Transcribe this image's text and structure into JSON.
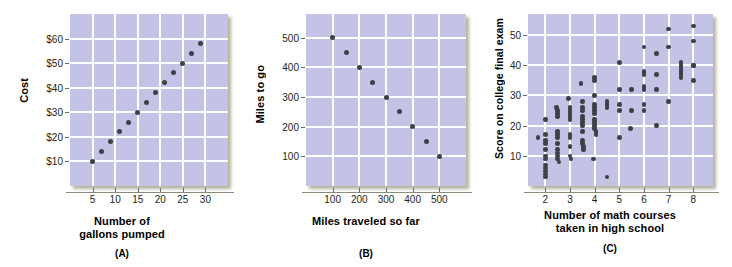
{
  "figure": {
    "panels": [
      {
        "tag": "(A)",
        "xlabel_lines": [
          "Number of",
          "gallons pumped"
        ],
        "ylabel": "Cost"
      },
      {
        "tag": "(B)",
        "xlabel_lines": [
          "Miles traveled so far"
        ],
        "ylabel": "Miles to go"
      },
      {
        "tag": "(C)",
        "xlabel_lines": [
          "Number of math courses",
          "taken in high school"
        ],
        "ylabel": "Score on college final exam"
      }
    ],
    "colors": {
      "plot_background": "#c3c3e6",
      "gridline": "#ffffff",
      "dot": "#3d4046",
      "text": "#000000"
    }
  },
  "chart_data": [
    {
      "type": "scatter",
      "title": "(A)",
      "xlabel": "Number of gallons pumped",
      "ylabel": "Cost",
      "xlim": [
        0,
        35
      ],
      "ylim": [
        0,
        70
      ],
      "xticks": [
        5,
        10,
        15,
        20,
        25,
        30
      ],
      "xtick_labels": [
        "5",
        "10",
        "15",
        "20",
        "25",
        "30"
      ],
      "yticks": [
        10,
        20,
        30,
        40,
        50,
        60
      ],
      "ytick_labels": [
        "$10",
        "$20",
        "$30",
        "$40",
        "$50",
        "$60"
      ],
      "grid": true,
      "legend": null,
      "x": [
        5,
        7,
        9,
        11,
        13,
        15,
        17,
        19,
        21,
        23,
        25,
        27,
        29
      ],
      "y": [
        10,
        14,
        18,
        22,
        26,
        30,
        34,
        38,
        42,
        46,
        50,
        54,
        58
      ]
    },
    {
      "type": "scatter",
      "title": "(B)",
      "xlabel": "Miles traveled so far",
      "ylabel": "Miles to go",
      "xlim": [
        0,
        600
      ],
      "ylim": [
        0,
        580
      ],
      "xticks": [
        100,
        200,
        300,
        400,
        500
      ],
      "xtick_labels": [
        "100",
        "200",
        "300",
        "400",
        "500"
      ],
      "yticks": [
        100,
        200,
        300,
        400,
        500
      ],
      "ytick_labels": [
        "100",
        "200",
        "300",
        "400",
        "500"
      ],
      "grid": true,
      "legend": null,
      "x": [
        100,
        150,
        200,
        250,
        300,
        350,
        400,
        450,
        500
      ],
      "y": [
        500,
        450,
        400,
        350,
        300,
        250,
        200,
        150,
        100
      ]
    },
    {
      "type": "scatter",
      "title": "(C)",
      "xlabel": "Number of math courses taken in high school",
      "ylabel": "Score on college final exam",
      "xlim": [
        1.3,
        8.8
      ],
      "ylim": [
        0,
        57
      ],
      "xticks": [
        2,
        3,
        4,
        5,
        6,
        7,
        8
      ],
      "xtick_labels": [
        "2",
        "3",
        "4",
        "5",
        "6",
        "7",
        "8"
      ],
      "yticks": [
        10,
        20,
        30,
        40,
        50
      ],
      "ytick_labels": [
        "10",
        "20",
        "30",
        "40",
        "50"
      ],
      "grid": true,
      "legend": null,
      "x": [
        1.7,
        2.0,
        2.0,
        2.0,
        2.0,
        2.0,
        2.0,
        2.0,
        2.0,
        2.0,
        2.0,
        2.0,
        2.0,
        2.45,
        2.5,
        2.5,
        2.5,
        2.5,
        2.5,
        2.5,
        2.5,
        2.5,
        2.5,
        2.5,
        2.5,
        2.55,
        2.95,
        3.0,
        3.0,
        3.0,
        3.0,
        3.0,
        3.0,
        3.0,
        3.0,
        3.0,
        3.05,
        3.45,
        3.5,
        3.5,
        3.5,
        3.5,
        3.5,
        3.5,
        3.5,
        3.5,
        3.5,
        3.5,
        3.55,
        3.55,
        3.95,
        4.0,
        4.0,
        4.0,
        4.0,
        4.0,
        4.0,
        4.0,
        4.0,
        4.0,
        4.0,
        4.0,
        4.05,
        4.05,
        4.5,
        4.5,
        4.5,
        4.5,
        5.0,
        5.0,
        5.0,
        5.0,
        5.0,
        5.45,
        5.5,
        5.5,
        6.0,
        6.0,
        6.0,
        6.0,
        6.0,
        6.0,
        6.0,
        6.5,
        6.5,
        6.5,
        6.5,
        7.0,
        7.0,
        7.0,
        7.5,
        7.5,
        7.5,
        7.5,
        7.5,
        7.5,
        8.0,
        8.0,
        8.0,
        8.0,
        8.0
      ],
      "y": [
        16,
        22,
        17,
        15,
        14,
        12,
        10,
        9,
        7,
        6,
        5,
        4,
        3,
        26,
        25,
        24,
        23,
        18,
        17,
        16,
        14,
        12,
        11,
        10,
        9,
        8,
        29,
        26,
        25,
        24,
        23,
        22,
        17,
        16,
        13,
        10,
        9,
        34,
        28,
        26,
        25,
        23,
        22,
        21,
        20,
        18,
        15,
        14,
        13,
        12,
        9,
        36,
        35,
        30,
        27,
        26,
        25,
        24,
        22,
        21,
        20,
        19,
        18,
        17,
        3,
        28,
        27,
        26,
        16,
        41,
        32,
        27,
        25,
        19,
        25,
        32,
        25,
        46,
        38,
        37,
        33,
        32,
        27,
        20,
        44,
        37,
        32,
        28,
        52,
        46,
        37,
        41,
        40,
        39,
        38,
        36,
        35,
        53,
        48,
        40,
        40,
        40
      ]
    }
  ]
}
